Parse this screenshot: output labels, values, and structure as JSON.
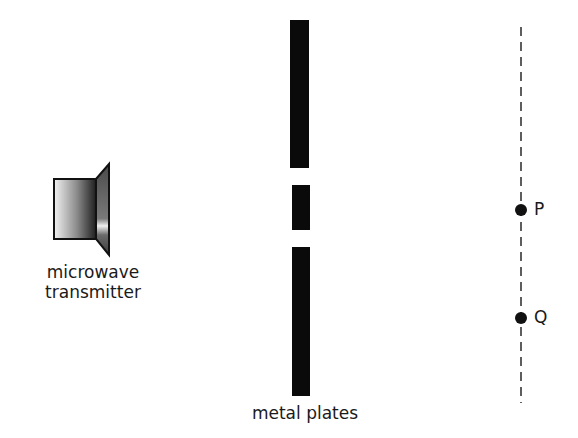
{
  "diagram": {
    "transmitter": {
      "label_line1": "microwave",
      "label_line2": "transmitter"
    },
    "plates": {
      "label": "metal plates",
      "count": 3
    },
    "points": [
      {
        "name": "P"
      },
      {
        "name": "Q"
      }
    ],
    "colors": {
      "plate": "#0a0a0a",
      "line": "#1a1a1a",
      "background": "#ffffff"
    }
  }
}
